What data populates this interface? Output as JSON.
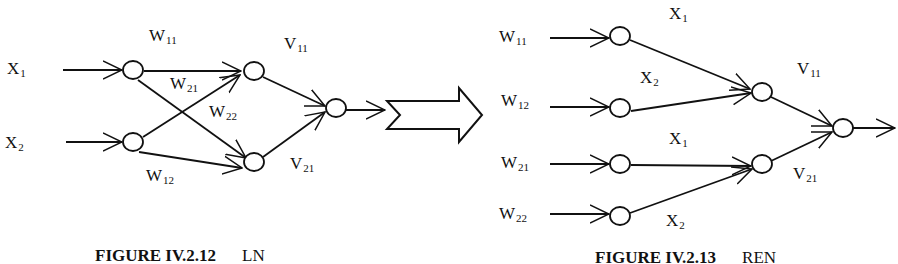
{
  "left_figure": {
    "caption": "FIGURE IV.2.12",
    "caption_tag": "LN",
    "inputs": [
      {
        "base": "X",
        "sub": "1"
      },
      {
        "base": "X",
        "sub": "2"
      }
    ],
    "weights": [
      {
        "base": "W",
        "sub": "11"
      },
      {
        "base": "W",
        "sub": "21"
      },
      {
        "base": "W",
        "sub": "22"
      },
      {
        "base": "W",
        "sub": "12"
      }
    ],
    "output_weights": [
      {
        "base": "V",
        "sub": "11"
      },
      {
        "base": "V",
        "sub": "21"
      }
    ]
  },
  "transform_arrow": "block-arrow",
  "right_figure": {
    "caption": "FIGURE IV.2.13",
    "caption_tag": "REN",
    "inputs": [
      {
        "base": "W",
        "sub": "11"
      },
      {
        "base": "W",
        "sub": "12"
      },
      {
        "base": "W",
        "sub": "21"
      },
      {
        "base": "W",
        "sub": "22"
      }
    ],
    "edge_labels": [
      {
        "base": "X",
        "sub": "1"
      },
      {
        "base": "X",
        "sub": "2"
      },
      {
        "base": "X",
        "sub": "1"
      },
      {
        "base": "X",
        "sub": "2"
      }
    ],
    "output_weights": [
      {
        "base": "V",
        "sub": "11"
      },
      {
        "base": "V",
        "sub": "21"
      }
    ]
  }
}
